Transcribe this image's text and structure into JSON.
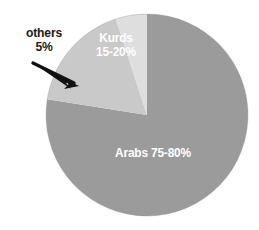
{
  "chart_data": {
    "type": "pie",
    "title": "",
    "subtitle": "",
    "xlabel": "",
    "ylabel": "",
    "legend": "none",
    "grid": false,
    "background_color": "#ffffff",
    "total_label": "",
    "categories": [
      "Arabs",
      "Kurds",
      "others"
    ],
    "values": [
      77.5,
      17.5,
      5
    ],
    "slices": [
      {
        "name": "Arabs",
        "label_name": "Arabs",
        "label_value": "75-80%",
        "label_full": "Arabs 75-80%",
        "value": 77.5,
        "range_low": 75,
        "range_high": 80,
        "color": "#9b9b9b",
        "label_color": "#ffffff",
        "label_placement": "inside"
      },
      {
        "name": "Kurds",
        "label_name": "Kurds",
        "label_value": "15-20%",
        "label_full": "Kurds 15-20%",
        "value": 17.5,
        "range_low": 15,
        "range_high": 20,
        "color": "#c9c9c9",
        "label_color": "#ffffff",
        "label_placement": "inside"
      },
      {
        "name": "others",
        "label_name": "others",
        "label_value": "5%",
        "label_full": "others 5%",
        "value": 5,
        "range_low": 5,
        "range_high": 5,
        "color": "#dedede",
        "label_color": "#1a1a1a",
        "label_placement": "outside-callout"
      }
    ],
    "annotations": [
      {
        "name": "others-callout-arrow",
        "icon": "arrow-icon",
        "points_to": "others",
        "direction": "down-right",
        "color": "#111111"
      }
    ],
    "geometry": {
      "center_x": 147,
      "center_y": 115,
      "radius": 101,
      "start_angle_deg": 0,
      "direction": "clockwise"
    }
  }
}
